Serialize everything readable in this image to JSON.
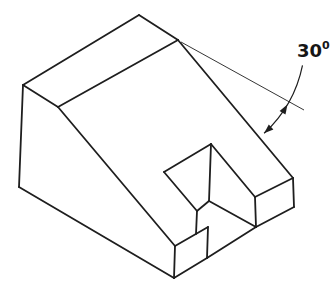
{
  "figure": {
    "kind": "isometric-technical-drawing",
    "canvas": {
      "width": 333,
      "height": 290,
      "background": "#ffffff",
      "stroke_color": "#1e1e1e"
    },
    "line_weights": {
      "main": 1.8,
      "extension": 0.9,
      "arc": 1.2
    },
    "vertices": {
      "A": [
        139,
        15
      ],
      "B": [
        23,
        85
      ],
      "C": [
        19,
        187
      ],
      "D": [
        174,
        278
      ],
      "E": [
        175,
        246
      ],
      "F": [
        58,
        107
      ],
      "G": [
        178,
        40
      ],
      "L1": [
        208,
        227
      ],
      "L2": [
        207,
        258
      ],
      "R1": [
        293,
        178
      ],
      "R2": [
        294,
        207
      ],
      "R3": [
        255,
        197
      ],
      "R4": [
        256,
        227
      ],
      "S1": [
        164,
        172
      ],
      "S2": [
        211,
        144
      ],
      "J1": [
        209,
        201
      ],
      "J2": [
        197,
        211
      ],
      "J3": [
        196,
        234
      ]
    },
    "edges": [
      [
        "B",
        "A"
      ],
      [
        "A",
        "G"
      ],
      [
        "B",
        "F"
      ],
      [
        "F",
        "G"
      ],
      [
        "B",
        "C"
      ],
      [
        "C",
        "D"
      ],
      [
        "F",
        "E"
      ],
      [
        "E",
        "D"
      ],
      [
        "E",
        "L1"
      ],
      [
        "L1",
        "L2"
      ],
      [
        "D",
        "L2"
      ],
      [
        "G",
        "R1"
      ],
      [
        "R1",
        "R2"
      ],
      [
        "R3",
        "R1"
      ],
      [
        "R3",
        "R4"
      ],
      [
        "R4",
        "R2"
      ],
      [
        "L2",
        "R4"
      ],
      [
        "S1",
        "S2"
      ],
      [
        "S2",
        "R3"
      ],
      [
        "S2",
        "J1"
      ],
      [
        "S1",
        "J2"
      ],
      [
        "J2",
        "J1"
      ],
      [
        "J1",
        "R4"
      ],
      [
        "J2",
        "J3"
      ]
    ],
    "dimension": {
      "extension_line": {
        "from": [
          181,
          42
        ],
        "to": [
          304,
          110
        ]
      },
      "arc": {
        "cx": 178,
        "cy": 40,
        "r": 127,
        "start_deg": 11.5,
        "end_deg": 47.3
      },
      "arrows": [
        {
          "x": 287.4,
          "y": 104.5,
          "angle_deg": -59.5
        },
        {
          "x": 264.1,
          "y": 133.3,
          "angle_deg": 137.3
        }
      ],
      "label": {
        "text": "30°",
        "number": "30",
        "degree_symbol": "0",
        "x": 297,
        "y": 42
      }
    }
  }
}
